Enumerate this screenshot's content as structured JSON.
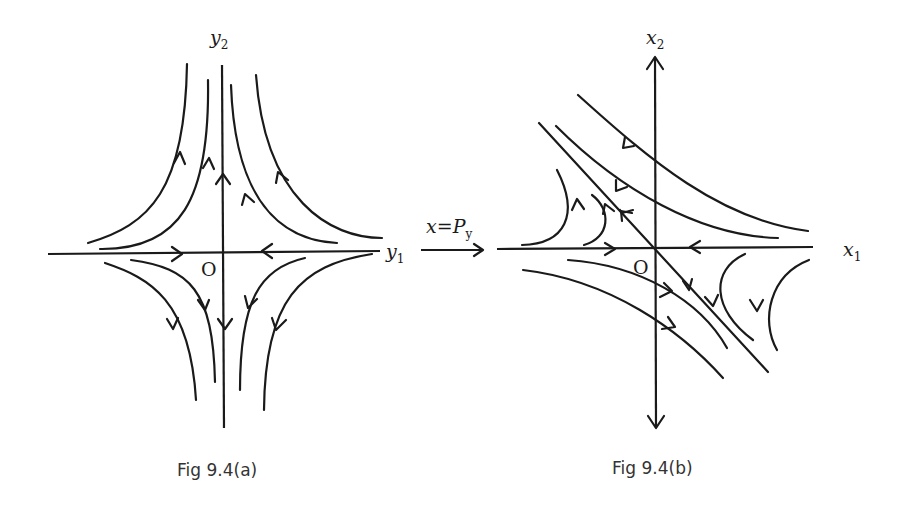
{
  "figure_a": {
    "caption": "Fig 9.4(a)",
    "x_axis_label": "y",
    "x_axis_sub": "1",
    "y_axis_label": "y",
    "y_axis_sub": "2",
    "origin_label": "O",
    "description": "Saddle point phase portrait in canonical coordinates (y1, y2): trajectories approach along y1 axis and depart along y2 axis"
  },
  "transform": {
    "label_main": "x=P",
    "label_sub": "y",
    "arrow": "right"
  },
  "figure_b": {
    "caption": "Fig 9.4(b)",
    "x_axis_label": "x",
    "x_axis_sub": "1",
    "y_axis_label": "x",
    "y_axis_sub": "2",
    "origin_label": "O",
    "description": "Saddle point phase portrait in original coordinates (x1, x2): stable manifold along x1 axis, unstable manifold along diagonal line"
  },
  "colors": {
    "stroke": "#1a1a1a",
    "caption": "#333333",
    "background": "#ffffff"
  }
}
